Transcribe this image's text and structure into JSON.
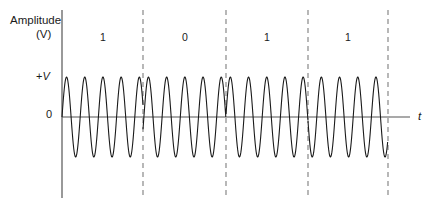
{
  "figure": {
    "kind": "phase-shift-keying-waveform",
    "width": 436,
    "height": 205,
    "background_color": "#ffffff",
    "stroke_color": "#1a1a1a",
    "dashed_color": "#9a9a9a"
  },
  "axes": {
    "y_title_line1": "Amplitude",
    "y_title_line2": "(V)",
    "y_tick_high_label": "+",
    "y_tick_high_symbol": "V",
    "y_tick_zero_label": "0",
    "x_axis_label": "t",
    "y_axis_x": 62,
    "y_axis_top": 10,
    "y_axis_bottom": 198,
    "baseline_y": 117,
    "x_axis_end": 410,
    "peak_y": 77,
    "trough_y": 157
  },
  "bits": [
    {
      "label": "1",
      "center_x": 103,
      "start_x": 62,
      "end_x": 143,
      "phase_deg": 0
    },
    {
      "label": "0",
      "center_x": 185,
      "start_x": 143,
      "end_x": 226,
      "phase_deg": 180
    },
    {
      "label": "1",
      "center_x": 267,
      "start_x": 226,
      "end_x": 308,
      "phase_deg": 0
    },
    {
      "label": "1",
      "center_x": 348,
      "start_x": 308,
      "end_x": 388,
      "phase_deg": 0
    }
  ],
  "boundaries": [
    {
      "x": 143
    },
    {
      "x": 226
    },
    {
      "x": 308
    },
    {
      "x": 388
    }
  ],
  "chart_data": {
    "type": "line",
    "title": "",
    "xlabel": "t",
    "ylabel": "Amplitude (V)",
    "ytick_labels": [
      "+V",
      "0"
    ],
    "grid": false,
    "legend": false,
    "modulation": "phase-shift keying (BPSK)",
    "bit_sequence": [
      "1",
      "0",
      "1",
      "1"
    ],
    "carrier_period_px": 18.2,
    "amplitude_px": 40,
    "phase_per_bit_deg": [
      0,
      180,
      0,
      0
    ],
    "segment_boundaries_px": [
      62,
      143,
      226,
      308,
      388
    ]
  }
}
